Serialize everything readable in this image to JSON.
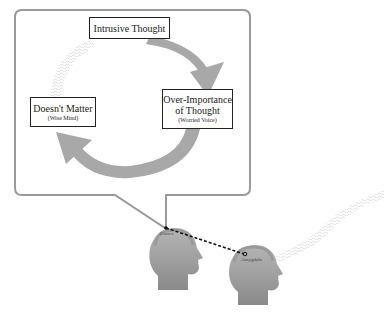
{
  "diagram": {
    "type": "thought-cycle",
    "nodes": {
      "top": {
        "title": "Intrusive Thought"
      },
      "right": {
        "title_line1": "Over-Importance",
        "title_line2": "of Thought",
        "subtitle": "(Worried Voice)"
      },
      "left": {
        "title": "Doesn't Matter",
        "subtitle": "(Wise Mind)"
      }
    },
    "brain_regions": {
      "front_head": "Cortex",
      "back_head": "Amygdala"
    },
    "connector": {
      "style": "dashed",
      "from": "Cortex",
      "to": "Amygdala"
    },
    "colors": {
      "arrow": "#a8a8a8",
      "bubble_border": "#9a9a9a",
      "head_fill": "#9c9c9c",
      "box_border": "#222222",
      "dashed_line": "#111111"
    }
  }
}
